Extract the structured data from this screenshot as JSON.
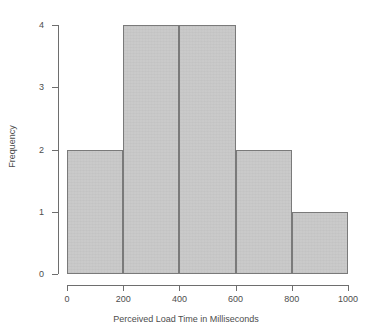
{
  "chart_data": {
    "type": "bar",
    "title": "",
    "subtitle": "",
    "xlabel": "Perceived Load Time in Milliseconds",
    "ylabel": "Frequency",
    "categories": [
      "0-200",
      "200-400",
      "400-600",
      "600-800",
      "800-1000"
    ],
    "bin_edges": [
      0,
      200,
      400,
      600,
      800,
      1000
    ],
    "values": [
      2,
      4,
      4,
      2,
      1
    ],
    "bin_width": 200,
    "xlim": [
      0,
      1000
    ],
    "ylim": [
      0,
      4
    ],
    "xticks": [
      0,
      200,
      400,
      600,
      800,
      1000
    ],
    "yticks": [
      0,
      1,
      2,
      3,
      4
    ],
    "xtick_labels": [
      "0",
      "200",
      "400",
      "600",
      "800",
      "1000"
    ],
    "ytick_labels": [
      "0",
      "1",
      "2",
      "3",
      "4"
    ],
    "grid": false,
    "legend": false,
    "legend_position": "none",
    "bar_fill_color": "#c8c8c8",
    "bar_border_color": "#7a7a7a",
    "axis_color": "#6e6e6e",
    "text_color": "#4d4d4d",
    "background_color": "#ffffff"
  }
}
